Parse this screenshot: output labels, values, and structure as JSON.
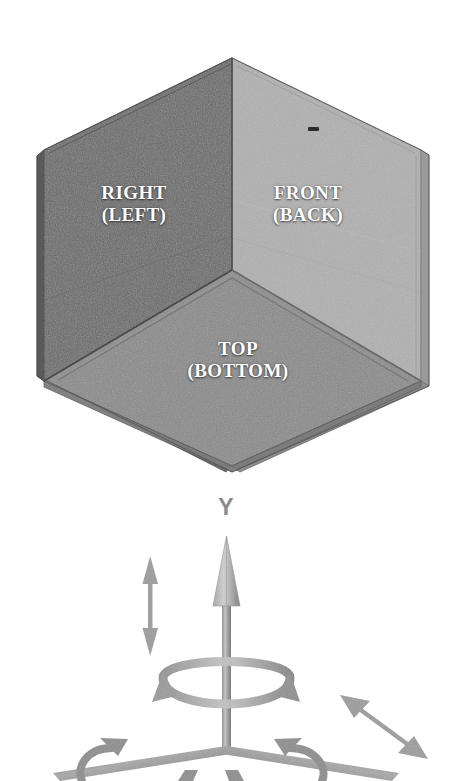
{
  "figure": {
    "title": "",
    "background_color": "#ffffff",
    "width": 451,
    "height": 781
  },
  "cube": {
    "faces": [
      {
        "id": "right",
        "primary_label": "RIGHT",
        "secondary_label": "(LEFT)",
        "fill_color": "#6a6a6a",
        "edge_color": "#4a4a4a"
      },
      {
        "id": "front",
        "primary_label": "FRONT",
        "secondary_label": "(BACK)",
        "fill_color": "#b0b0b0",
        "edge_color": "#8e8e8e"
      },
      {
        "id": "top",
        "primary_label": "TOP",
        "secondary_label": "(BOTTOM)",
        "fill_color": "#8a8a8a",
        "edge_color": "#6e6e6e"
      }
    ],
    "label_text_color": "#ffffff",
    "marker": {
      "id": "front-face-dash",
      "color": "#2b2b2b"
    }
  },
  "axes": {
    "y_axis_label": "Y",
    "axis_color": "#9a9a9a",
    "axis_shadow_color": "#6e6e6e",
    "indicators": [
      {
        "id": "y-translation-arrow",
        "kind": "double-headed-arrow",
        "direction": "vertical"
      },
      {
        "id": "y-rotation-arrow",
        "kind": "curved-rotation-arrow",
        "direction": "about-y"
      },
      {
        "id": "x-rotation-arrow",
        "kind": "curved-rotation-arrow",
        "direction": "about-x"
      },
      {
        "id": "z-rotation-arrow",
        "kind": "curved-rotation-arrow",
        "direction": "about-z"
      },
      {
        "id": "z-translation-arrow",
        "kind": "double-headed-arrow",
        "direction": "diagonal-down-right"
      }
    ]
  }
}
